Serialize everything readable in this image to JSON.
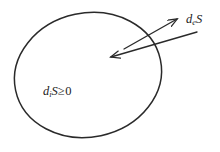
{
  "figure": {
    "background_color": "#ffffff",
    "line_color": "#2a2a2a",
    "text_color": "#1c1c1c"
  },
  "system_boundary": {
    "shape": "ellipse",
    "center_x": 88,
    "center_y": 75,
    "radius_x": 74,
    "radius_y": 62,
    "rotation_deg": -12,
    "stroke_width": 1.5,
    "fill": "none"
  },
  "arrows": [
    {
      "id": "entropy-outflow",
      "direction": "outward",
      "tail_x": 124,
      "tail_y": 49,
      "head_x": 179,
      "head_y": 18,
      "description": "entropy flowing out of the system"
    },
    {
      "id": "entropy-inflow",
      "direction": "inward",
      "tail_x": 197,
      "tail_y": 32,
      "head_x": 109,
      "head_y": 58,
      "description": "entropy flowing into the system"
    }
  ],
  "labels": {
    "exchange": {
      "id": "de-s",
      "base": "d",
      "subscript": "e",
      "variable": "S",
      "full_text": "deS",
      "meaning": "entropy exchanged with surroundings",
      "x": 186,
      "y": 13
    },
    "production": {
      "id": "di-s",
      "base": "d",
      "subscript": "i",
      "variable": "S",
      "relation": "≥",
      "value": "0",
      "full_text": "diS ≥ 0",
      "meaning": "internal entropy production is non-negative",
      "x": 43,
      "y": 85
    }
  }
}
